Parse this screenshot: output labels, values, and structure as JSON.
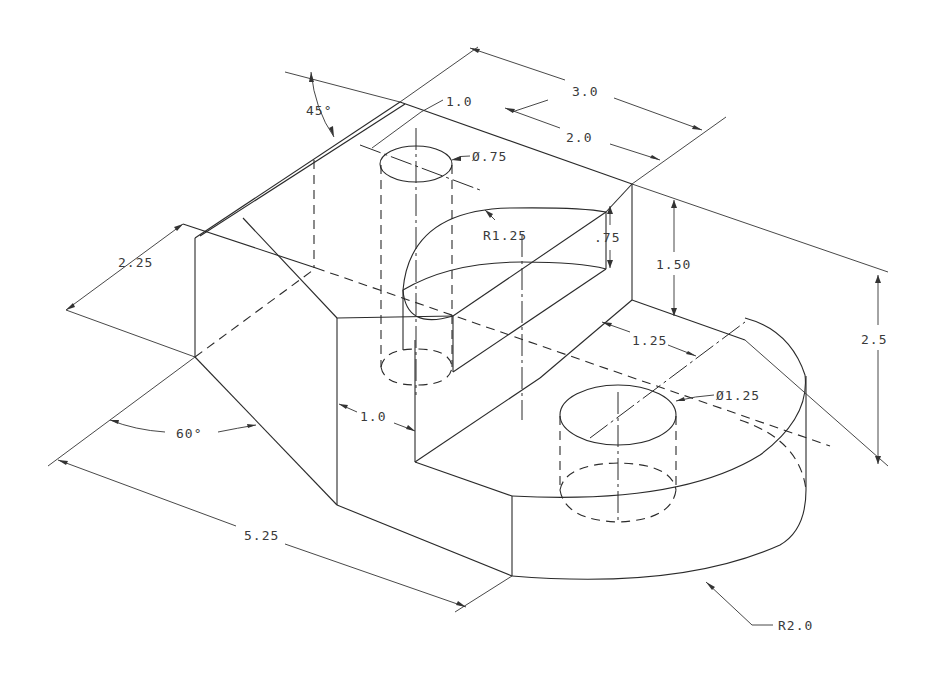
{
  "drawing": {
    "title": "Isometric drawing of machined block with cylindrical holes and rounded end",
    "line_color": "#2a2a2a",
    "background": "#ffffff"
  },
  "dimensions": {
    "angle_top": "45°",
    "angle_bottom": "60°",
    "width_overall": "3.0",
    "width_slot": "2.0",
    "offset_hole_small": "1.0",
    "dia_hole_small": "Ø.75",
    "radius_slot": "R1.25",
    "depth_slot": ".75",
    "height_step": "1.50",
    "height_overall": "2.5",
    "depth_left": "2.25",
    "offset_hole_large": "1.25",
    "dia_hole_large": "Ø1.25",
    "wall_thickness": "1.0",
    "length_overall": "5.25",
    "radius_end": "R2.0"
  }
}
